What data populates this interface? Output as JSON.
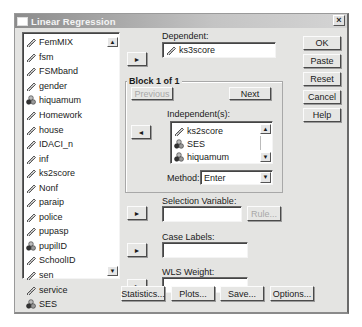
{
  "window": {
    "title": "Linear Regression",
    "close_label": "×"
  },
  "variables": {
    "items": [
      {
        "name": "FemMIX",
        "icon": "scale-icon"
      },
      {
        "name": "fsm",
        "icon": "scale-icon"
      },
      {
        "name": "FSMband",
        "icon": "scale-icon"
      },
      {
        "name": "gender",
        "icon": "scale-icon"
      },
      {
        "name": "hiquamum",
        "icon": "nominal-icon"
      },
      {
        "name": "Homework",
        "icon": "scale-icon"
      },
      {
        "name": "house",
        "icon": "scale-icon"
      },
      {
        "name": "IDACI_n",
        "icon": "scale-icon"
      },
      {
        "name": "inf",
        "icon": "scale-icon"
      },
      {
        "name": "ks2score",
        "icon": "scale-icon"
      },
      {
        "name": "Nonf",
        "icon": "scale-icon"
      },
      {
        "name": "paraip",
        "icon": "scale-icon"
      },
      {
        "name": "police",
        "icon": "scale-icon"
      },
      {
        "name": "pupasp",
        "icon": "scale-icon"
      },
      {
        "name": "pupilID",
        "icon": "nominal-icon"
      },
      {
        "name": "SchoolID",
        "icon": "scale-icon"
      },
      {
        "name": "sen",
        "icon": "scale-icon"
      },
      {
        "name": "service",
        "icon": "scale-icon"
      },
      {
        "name": "SES",
        "icon": "nominal-icon"
      }
    ],
    "scroll_up": "▲",
    "scroll_down": "▼"
  },
  "dependent": {
    "label": "Dependent:",
    "value": "ks3score",
    "arrow": "►"
  },
  "block": {
    "label": "Block 1 of 1",
    "previous_label": "Previous",
    "next_label": "Next"
  },
  "independents": {
    "label": "Independent(s):",
    "arrow": "◄",
    "items": [
      {
        "name": "ks2score",
        "icon": "scale-icon"
      },
      {
        "name": "SES",
        "icon": "nominal-icon"
      },
      {
        "name": "hiquamum",
        "icon": "nominal-icon"
      }
    ],
    "scroll_up": "▲",
    "scroll_down": "▼"
  },
  "method": {
    "label": "Method:",
    "value": "Enter",
    "dropdown": "▼"
  },
  "selection_variable": {
    "label": "Selection Variable:",
    "value": "",
    "rule_label": "Rule...",
    "arrow": "►"
  },
  "case_labels": {
    "label": "Case Labels:",
    "value": "",
    "arrow": "►"
  },
  "wls_weight": {
    "label": "WLS Weight:",
    "value": "",
    "arrow": "►"
  },
  "side_buttons": {
    "ok": "OK",
    "paste": "Paste",
    "reset": "Reset",
    "cancel": "Cancel",
    "help": "Help"
  },
  "bottom_buttons": {
    "statistics": "Statistics...",
    "plots": "Plots...",
    "save": "Save...",
    "options": "Options..."
  }
}
